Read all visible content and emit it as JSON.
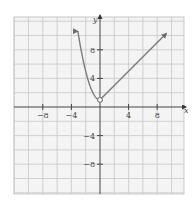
{
  "chart_data": {
    "type": "line",
    "title": "",
    "xlabel": "x",
    "ylabel": "y",
    "xlim": [
      -12,
      12
    ],
    "ylim": [
      -12,
      12.6
    ],
    "grid": true,
    "grid_step": 2,
    "x_ticks": [
      {
        "value": -8,
        "label": "−8"
      },
      {
        "value": -4,
        "label": "−4"
      },
      {
        "value": 4,
        "label": "4"
      },
      {
        "value": 8,
        "label": "8"
      }
    ],
    "y_ticks": [
      {
        "value": 8,
        "label": "8"
      },
      {
        "value": 4,
        "label": "4"
      },
      {
        "value": -4,
        "label": "−4"
      },
      {
        "value": -8,
        "label": "−8"
      }
    ],
    "series": [
      {
        "name": "left branch (parabola, x < 0)",
        "formula": "y = x^2 + 1",
        "x": [
          -3.1,
          -3,
          -2.5,
          -2,
          -1.5,
          -1,
          -0.5,
          0
        ],
        "y": [
          10.61,
          10,
          7.25,
          5,
          3.25,
          2,
          1.25,
          1
        ],
        "end_arrow": "left"
      },
      {
        "name": "right branch (line, x > 0)",
        "formula": "y = x + 1",
        "x": [
          0,
          9.3
        ],
        "y": [
          1,
          10.3
        ],
        "end_arrow": "right"
      }
    ],
    "annotations": [
      {
        "type": "open_circle",
        "x": 0,
        "y": 1
      }
    ],
    "colors": {
      "curve": "#7a7a7a",
      "axis": "#444444",
      "grid": "#c8c8c8",
      "background": "#f4f4f4"
    }
  }
}
